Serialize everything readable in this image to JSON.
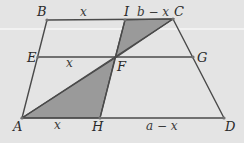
{
  "diagram": {
    "type": "trapezoid-geometry",
    "colors": {
      "background": "#e4e4e4",
      "stroke": "#4a4a4a",
      "shade": "#9a9a9a",
      "text": "#2a2a2a"
    },
    "points": {
      "A": {
        "label": "A",
        "x": 22,
        "y": 118
      },
      "B": {
        "label": "B",
        "x": 47,
        "y": 20
      },
      "C": {
        "label": "C",
        "x": 173,
        "y": 19
      },
      "D": {
        "label": "D",
        "x": 224,
        "y": 118
      },
      "E": {
        "label": "E",
        "x": 38,
        "y": 57
      },
      "F": {
        "label": "F",
        "x": 115,
        "y": 58
      },
      "G": {
        "label": "G",
        "x": 193,
        "y": 57
      },
      "H": {
        "label": "H",
        "x": 100,
        "y": 118
      },
      "I": {
        "label": "I",
        "x": 125,
        "y": 20
      }
    },
    "segment_labels": {
      "BI": "x",
      "IC": "b − x",
      "EF": "x",
      "AH": "x",
      "HD": "a − x"
    },
    "shaded_regions": [
      {
        "name": "triangle-IFC",
        "vertices": [
          "I",
          "F",
          "C"
        ]
      },
      {
        "name": "triangle-AHF",
        "vertices": [
          "A",
          "H",
          "F"
        ]
      }
    ]
  }
}
